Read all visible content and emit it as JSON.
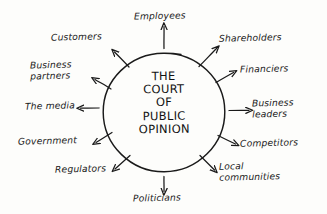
{
  "diagram": {
    "center": {
      "name": "court-of-public-opinion",
      "lines": [
        "THE",
        "COURT",
        "OF",
        "PUBLIC",
        "OPINION"
      ],
      "full_text": "THE COURT OF PUBLIC OPINION"
    },
    "colors": {
      "ink": "#1a1a1a",
      "background": "#fdfdfb"
    },
    "stakeholders": [
      {
        "id": "employees",
        "label": "Employees",
        "position": "top",
        "arrow": "up"
      },
      {
        "id": "shareholders",
        "label": "Shareholders",
        "position": "top-right",
        "arrow": "up-right"
      },
      {
        "id": "financiers",
        "label": "Financiers",
        "position": "right-upper",
        "arrow": "right-up"
      },
      {
        "id": "business-leaders",
        "label": "Business\nleaders",
        "position": "right",
        "arrow": "right"
      },
      {
        "id": "competitors",
        "label": "Competitors",
        "position": "right-lower",
        "arrow": "right-down"
      },
      {
        "id": "local-communities",
        "label": "Local\ncommunities",
        "position": "bottom-right",
        "arrow": "down-right"
      },
      {
        "id": "politicians",
        "label": "Politicians",
        "position": "bottom",
        "arrow": "down"
      },
      {
        "id": "regulators",
        "label": "Regulators",
        "position": "bottom-left",
        "arrow": "down-left"
      },
      {
        "id": "government",
        "label": "Government",
        "position": "left-lower",
        "arrow": "left-down"
      },
      {
        "id": "the-media",
        "label": "The media",
        "position": "left",
        "arrow": "left"
      },
      {
        "id": "business-partners",
        "label": "Business\npartners",
        "position": "left-upper",
        "arrow": "left-up"
      },
      {
        "id": "customers",
        "label": "Customers",
        "position": "top-left",
        "arrow": "up-left"
      }
    ]
  }
}
